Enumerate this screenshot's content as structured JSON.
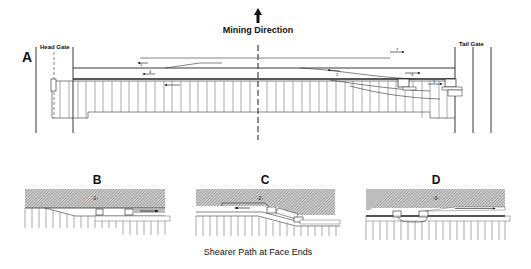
{
  "title": "Mining Direction",
  "caption": "Shearer Path at Face Ends",
  "panels": {
    "A": {
      "label": "A",
      "head_gate": "Head Gate",
      "tail_gate": "Tail Gate",
      "path_numbers": [
        "5",
        "4",
        "7",
        "3",
        "2",
        "1"
      ]
    },
    "B": {
      "label": "B",
      "step": "-1-"
    },
    "C": {
      "label": "C",
      "step": "-2-"
    },
    "D": {
      "label": "D",
      "step": "-3-"
    }
  },
  "colors": {
    "line": "#222222",
    "hatch": "#9a9a9a",
    "background": "#ffffff"
  }
}
